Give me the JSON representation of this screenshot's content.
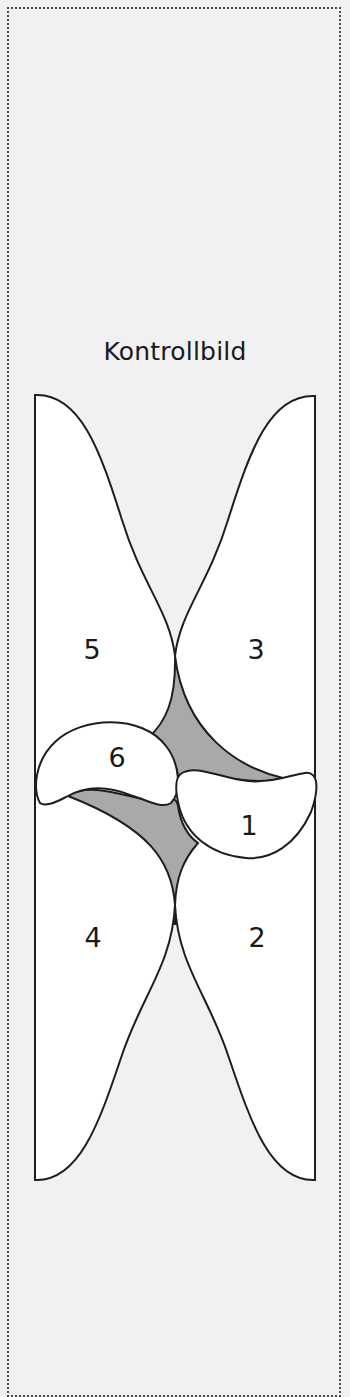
{
  "title": "Kontrollbild",
  "pieces": [
    {
      "id": "1",
      "label": "1"
    },
    {
      "id": "2",
      "label": "2"
    },
    {
      "id": "3",
      "label": "3"
    },
    {
      "id": "4",
      "label": "4"
    },
    {
      "id": "5",
      "label": "5"
    },
    {
      "id": "6",
      "label": "6"
    }
  ],
  "colors": {
    "background": "#f1f1f1",
    "piece_fill": "#ffffff",
    "gap_fill": "#a9a9a9",
    "outline": "#1e1e1e",
    "border": "#4a4a4a"
  }
}
